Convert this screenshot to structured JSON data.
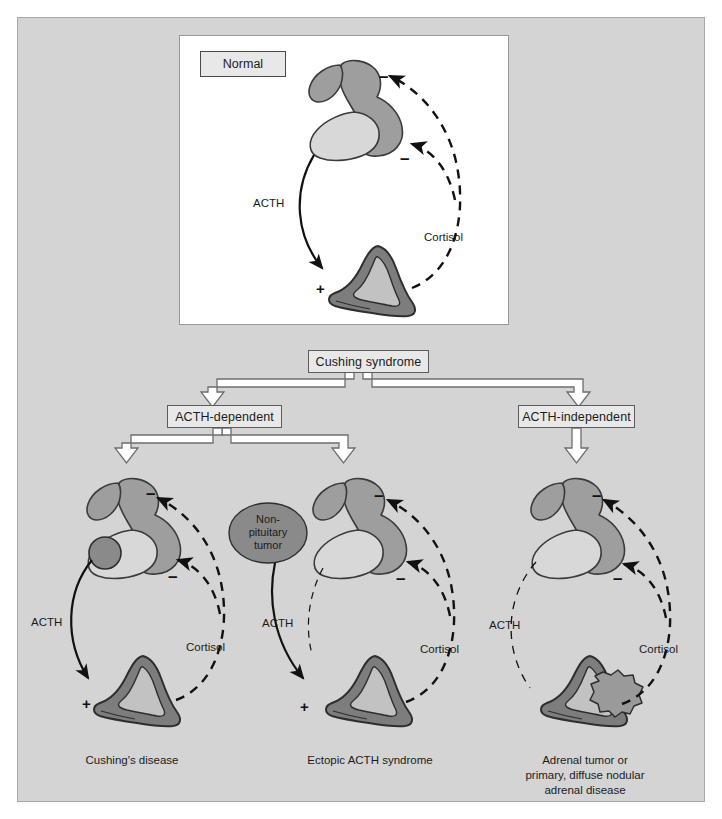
{
  "figure": {
    "title_box": {
      "label": "Normal"
    },
    "palette": {
      "page_background": "#ffffff",
      "panel_background": "#d4d4d4",
      "panel_border": "#a8a8a8",
      "card_background": "#ffffff",
      "box_fill": "#e8e8e8",
      "box_border": "#5c5c5c",
      "hypothalamus_fill": "#9e9e9e",
      "anterior_pituitary_fill": "#d8d8d8",
      "pituitary_outline": "#3b3b3b",
      "adrenal_cortex_fill": "#7d7d7d",
      "adrenal_medulla_fill": "#c2c2c2",
      "tumor_fill": "#8a8a8a",
      "arrow_stroke": "#111111",
      "block_arrow_fill": "#ffffff",
      "block_arrow_stroke": "#6e6e6e",
      "text": "#1b1b1b"
    }
  },
  "flow": {
    "root": {
      "label": "Cushing syndrome"
    },
    "branches": [
      {
        "label": "ACTH-dependent"
      },
      {
        "label": "ACTH-independent"
      }
    ]
  },
  "panels": {
    "normal": {
      "name": "Normal",
      "acth_label": "ACTH",
      "cortisol_label": "Cortisol",
      "stimulus_sign": "+",
      "feedback_sign_upper": "–",
      "feedback_sign_lower": "–",
      "acth_active": true,
      "cortisol_active": true
    },
    "cushings_disease": {
      "caption": "Cushing's disease",
      "acth_label": "ACTH",
      "cortisol_label": "Cortisol",
      "stimulus_sign": "+",
      "feedback_sign_upper": "–",
      "feedback_sign_lower": "–",
      "has_pituitary_adenoma": true,
      "acth_active": true
    },
    "ectopic_acth": {
      "caption": "Ectopic ACTH syndrome",
      "acth_label": "ACTH",
      "cortisol_label": "Cortisol",
      "stimulus_sign": "+",
      "feedback_sign_upper": "–",
      "feedback_sign_lower": "–",
      "tumor_label": "Non-\npituitary\ntumor",
      "acth_active": true
    },
    "adrenal_tumor": {
      "caption": "Adrenal tumor or\nprimary, diffuse nodular\nadrenal disease",
      "acth_label": "ACTH",
      "cortisol_label": "Cortisol",
      "feedback_sign_upper": "–",
      "feedback_sign_lower": "–",
      "has_adrenal_nodule": true,
      "acth_active": false
    }
  }
}
